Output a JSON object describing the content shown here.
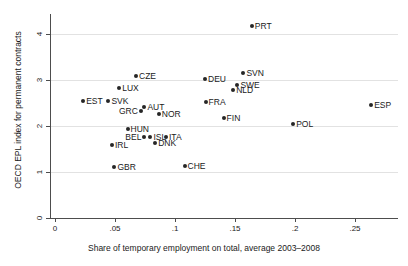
{
  "chart_data": {
    "type": "scatter",
    "title": "",
    "xlabel": "Share of temporary employment on total, average 2003–2008",
    "ylabel": "OECD EPL index for permanent contracts",
    "xlim": [
      0,
      0.286
    ],
    "ylim": [
      0,
      4.43
    ],
    "xticks": [
      0,
      0.05,
      0.1,
      0.15,
      0.2,
      0.25
    ],
    "xticklabels": [
      "0",
      ".05",
      ".1",
      ".15",
      ".2",
      ".25"
    ],
    "yticks": [
      0,
      1,
      2,
      3,
      4
    ],
    "yticklabels": [
      "0",
      "1",
      "2",
      "3",
      "4"
    ],
    "grid": "horizontal",
    "legend": "none",
    "marker_color": "#262626",
    "points": [
      {
        "label": "PRT",
        "x": 0.164,
        "y": 4.17,
        "side": "right"
      },
      {
        "label": "SVN",
        "x": 0.157,
        "y": 3.15,
        "side": "right"
      },
      {
        "label": "CZE",
        "x": 0.0675,
        "y": 3.09,
        "side": "right"
      },
      {
        "label": "DEU",
        "x": 0.125,
        "y": 3.02,
        "side": "right"
      },
      {
        "label": "SWE",
        "x": 0.152,
        "y": 2.89,
        "side": "right"
      },
      {
        "label": "LUX",
        "x": 0.0535,
        "y": 2.83,
        "side": "right"
      },
      {
        "label": "NLD",
        "x": 0.1485,
        "y": 2.78,
        "side": "right"
      },
      {
        "label": "EST",
        "x": 0.0235,
        "y": 2.54,
        "side": "right"
      },
      {
        "label": "SVK",
        "x": 0.0445,
        "y": 2.54,
        "side": "right"
      },
      {
        "label": "FRA",
        "x": 0.1255,
        "y": 2.52,
        "side": "right"
      },
      {
        "label": "ESP",
        "x": 0.2635,
        "y": 2.46,
        "side": "right"
      },
      {
        "label": "AUT",
        "x": 0.0745,
        "y": 2.41,
        "side": "right"
      },
      {
        "label": "GRC",
        "x": 0.0715,
        "y": 2.33,
        "side": "left"
      },
      {
        "label": "NOR",
        "x": 0.0865,
        "y": 2.26,
        "side": "right"
      },
      {
        "label": "FIN",
        "x": 0.1405,
        "y": 2.18,
        "side": "right"
      },
      {
        "label": "POL",
        "x": 0.1985,
        "y": 2.04,
        "side": "right"
      },
      {
        "label": "HUN",
        "x": 0.0605,
        "y": 1.93,
        "side": "right"
      },
      {
        "label": "ISL",
        "x": 0.0795,
        "y": 1.76,
        "side": "right"
      },
      {
        "label": "ITA",
        "x": 0.0925,
        "y": 1.76,
        "side": "right"
      },
      {
        "label": "BEL",
        "x": 0.0745,
        "y": 1.76,
        "side": "left"
      },
      {
        "label": "DNK",
        "x": 0.0835,
        "y": 1.63,
        "side": "right"
      },
      {
        "label": "IRL",
        "x": 0.0475,
        "y": 1.59,
        "side": "right"
      },
      {
        "label": "CHE",
        "x": 0.108,
        "y": 1.14,
        "side": "right"
      },
      {
        "label": "GBR",
        "x": 0.0495,
        "y": 1.11,
        "side": "right"
      }
    ]
  }
}
